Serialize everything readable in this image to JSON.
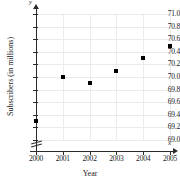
{
  "chart_data": {
    "type": "scatter",
    "title": "",
    "xlabel": "Year",
    "ylabel": "Subscribers (in millions)",
    "x": [
      2000,
      2001,
      2002,
      2003,
      2004,
      2005
    ],
    "values": [
      69.3,
      70.0,
      69.9,
      70.1,
      70.3,
      70.5
    ],
    "series": [
      {
        "name": "Subscribers",
        "points": [
          {
            "x": 2000,
            "y": 69.3
          },
          {
            "x": 2001,
            "y": 70.0
          },
          {
            "x": 2002,
            "y": 69.9
          },
          {
            "x": 2003,
            "y": 70.1
          },
          {
            "x": 2004,
            "y": 70.3
          },
          {
            "x": 2005,
            "y": 70.5
          }
        ]
      }
    ],
    "xlim": [
      2000,
      2005
    ],
    "ylim": [
      69.0,
      71.0
    ],
    "ytick_labels": [
      "71.0",
      "70.8",
      "70.6",
      "70.4",
      "70.2",
      "70.0",
      "69.8",
      "69.6",
      "69.4",
      "69.2",
      "69.0"
    ],
    "ytick_values": [
      71.0,
      70.8,
      70.6,
      70.4,
      70.2,
      70.0,
      69.8,
      69.6,
      69.4,
      69.2,
      69.0
    ],
    "xtick_labels": [
      "2000",
      "2001",
      "2002",
      "2003",
      "2004",
      "2005"
    ],
    "grid": true,
    "legend": "none",
    "axis_break_y": true,
    "axis_letters": {
      "x": "x",
      "y": "y"
    },
    "marker": "filled-square",
    "marker_color": "#000000",
    "grid_color": "#ebebeb",
    "axis_color": "#2b2b2b"
  }
}
